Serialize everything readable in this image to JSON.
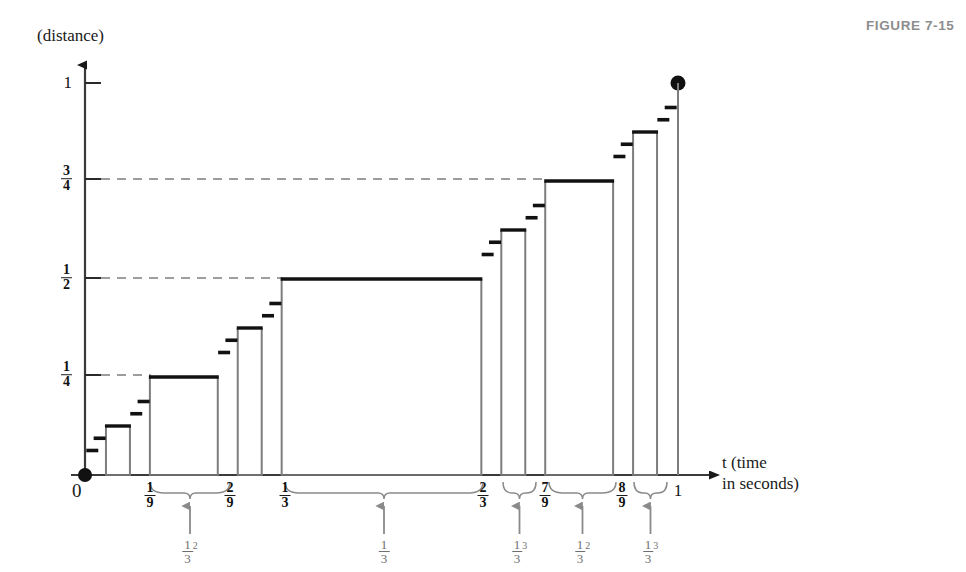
{
  "figure": {
    "id_label": "FIGURE 7-15",
    "id_color": "#8d8d8d"
  },
  "axes": {
    "y_axis_title": "(distance)",
    "x_axis_title_line1": "t (time",
    "x_axis_title_line2": "in seconds)",
    "x_axis_variable": "t",
    "origin_label": "0",
    "y_ticks": [
      {
        "value": 1,
        "label_type": "plain",
        "text": "1",
        "y_px": 83,
        "dashed": false
      },
      {
        "value": 0.75,
        "label_type": "fraction",
        "num": "3",
        "den": "4",
        "y_px": 179,
        "dashed": true
      },
      {
        "value": 0.5,
        "label_type": "fraction",
        "num": "1",
        "den": "2",
        "y_px": 278,
        "dashed": true
      },
      {
        "value": 0.25,
        "label_type": "fraction",
        "num": "1",
        "den": "4",
        "y_px": 375,
        "dashed": true
      }
    ],
    "x_ticks": [
      {
        "value": 0.1111,
        "label_type": "fraction",
        "num": "1",
        "den": "9",
        "x_px": 150
      },
      {
        "value": 0.2222,
        "label_type": "fraction",
        "num": "2",
        "den": "9",
        "x_px": 230
      },
      {
        "value": 0.3333,
        "label_type": "fraction",
        "num": "1",
        "den": "3",
        "x_px": 285
      },
      {
        "value": 0.6667,
        "label_type": "fraction",
        "num": "2",
        "den": "3",
        "x_px": 483
      },
      {
        "value": 0.7778,
        "label_type": "fraction",
        "num": "7",
        "den": "9",
        "x_px": 545
      },
      {
        "value": 0.8889,
        "label_type": "fraction",
        "num": "8",
        "den": "9",
        "x_px": 622
      },
      {
        "value": 1.0,
        "label_type": "plain",
        "text": "1",
        "x_px": 678
      }
    ]
  },
  "chart_data": {
    "type": "line",
    "xlabel": "t (time in seconds)",
    "ylabel": "(distance)",
    "xlim": [
      0,
      1
    ],
    "ylim": [
      0,
      1
    ],
    "grid": false,
    "legend": null,
    "note": "Open rectangles mark removed middle-third intervals where the displacement is constant; heavy short dashes mark the smaller constant steps. The filled dot marks the endpoint (1, 1).",
    "plateaus": [
      {
        "x0": 0.037037,
        "x1": 0.074074,
        "y": 0.125,
        "kind": "box"
      },
      {
        "x0": 0.111111,
        "x1": 0.222222,
        "y": 0.25,
        "kind": "box"
      },
      {
        "x0": 0.259259,
        "x1": 0.296296,
        "y": 0.375,
        "kind": "box"
      },
      {
        "x0": 0.333333,
        "x1": 0.666667,
        "y": 0.5,
        "kind": "box"
      },
      {
        "x0": 0.703704,
        "x1": 0.740741,
        "y": 0.625,
        "kind": "box"
      },
      {
        "x0": 0.777778,
        "x1": 0.888889,
        "y": 0.75,
        "kind": "box"
      },
      {
        "x0": 0.925926,
        "x1": 0.962963,
        "y": 0.875,
        "kind": "box"
      }
    ],
    "dashes": [
      {
        "x": 0.0123,
        "y": 0.0625
      },
      {
        "x": 0.0247,
        "y": 0.09375
      },
      {
        "x": 0.0864,
        "y": 0.15625
      },
      {
        "x": 0.0988,
        "y": 0.1875
      },
      {
        "x": 0.2346,
        "y": 0.3125
      },
      {
        "x": 0.2469,
        "y": 0.34375
      },
      {
        "x": 0.3086,
        "y": 0.40625
      },
      {
        "x": 0.321,
        "y": 0.4375
      },
      {
        "x": 0.679,
        "y": 0.5625
      },
      {
        "x": 0.6914,
        "y": 0.59375
      },
      {
        "x": 0.7531,
        "y": 0.65625
      },
      {
        "x": 0.7654,
        "y": 0.6875
      },
      {
        "x": 0.9012,
        "y": 0.8125
      },
      {
        "x": 0.9136,
        "y": 0.84375
      },
      {
        "x": 0.9753,
        "y": 0.90625
      },
      {
        "x": 0.9877,
        "y": 0.9375
      }
    ],
    "endpoint_dot": {
      "x": 1.0,
      "y": 1.0
    }
  },
  "braces": [
    {
      "name": "brace-one-ninth",
      "x_left": 150,
      "x_right": 230,
      "y_px": 482,
      "label_num": "1",
      "label_den": "3",
      "exponent": "2",
      "arrow_color": "#8a8a8a"
    },
    {
      "name": "brace-one-third",
      "x_left": 285,
      "x_right": 483,
      "y_px": 482,
      "label_num": "1",
      "label_den": "3",
      "exponent": "",
      "arrow_color": "#8a8a8a"
    },
    {
      "name": "brace-seven-ninths-left",
      "x_left": 503,
      "x_right": 536,
      "y_px": 482,
      "label_num": "1",
      "label_den": "3",
      "exponent": "3",
      "arrow_color": "#8a8a8a"
    },
    {
      "name": "brace-seven-to-eight-ninths",
      "x_left": 549,
      "x_right": 616,
      "y_px": 482,
      "label_num": "1",
      "label_den": "3",
      "exponent": "2",
      "arrow_color": "#8a8a8a"
    },
    {
      "name": "brace-eight-ninths-right",
      "x_left": 634,
      "x_right": 667,
      "y_px": 482,
      "label_num": "1",
      "label_den": "3",
      "exponent": "3",
      "arrow_color": "#8a8a8a"
    }
  ],
  "geometry": {
    "x0_px": 85,
    "x1_px": 678,
    "y0_px": 475,
    "y1_px": 83,
    "axis_color": "#4a4a4a",
    "plateau_color": "#111111",
    "box_side_color": "#7d7d7d",
    "dash_color": "#111111"
  }
}
